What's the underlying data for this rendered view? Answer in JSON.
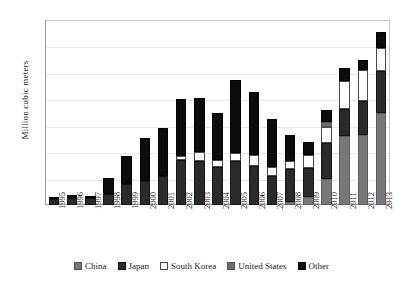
{
  "chart_data": {
    "type": "bar",
    "subtype": "stacked-vertical",
    "title": "",
    "xlabel": "",
    "ylabel": "Million cubic meters",
    "ylim": [
      0,
      7
    ],
    "yticks": [
      0,
      1,
      2,
      3,
      4,
      5,
      6,
      7
    ],
    "grid": true,
    "grid_axis": "y",
    "legend_position": "bottom",
    "stack_order_bottom_to_top": [
      "China",
      "Japan",
      "South Korea",
      "United States",
      "Other"
    ],
    "categories": [
      "1995",
      "1996",
      "1997",
      "1998",
      "1999",
      "2000",
      "2001",
      "2002",
      "2003",
      "2004",
      "2005",
      "2006",
      "2007",
      "2008",
      "2009",
      "2010",
      "2011",
      "2012",
      "2013"
    ],
    "series": [
      {
        "name": "China",
        "color": "#787878",
        "values": [
          0.0,
          0.0,
          0.0,
          0.0,
          0.0,
          0.0,
          0.0,
          0.0,
          0.0,
          0.0,
          0.0,
          0.0,
          0.0,
          0.1,
          0.3,
          1.0,
          2.6,
          2.65,
          3.5
        ]
      },
      {
        "name": "Japan",
        "color": "#2a2a2a",
        "values": [
          0.22,
          0.28,
          0.25,
          0.42,
          0.8,
          0.9,
          1.1,
          1.72,
          1.68,
          1.42,
          1.65,
          1.48,
          1.1,
          1.25,
          1.1,
          1.35,
          1.05,
          1.3,
          1.58
        ]
      },
      {
        "name": "South Korea",
        "color": "#ffffff",
        "values": [
          0.0,
          0.0,
          0.0,
          0.0,
          0.0,
          0.0,
          0.0,
          0.12,
          0.33,
          0.28,
          0.32,
          0.42,
          0.35,
          0.33,
          0.5,
          0.6,
          1.05,
          1.15,
          0.85
        ]
      },
      {
        "name": "United States",
        "color": "#6e6e6e",
        "values": [
          0.0,
          0.0,
          0.0,
          0.0,
          0.0,
          0.0,
          0.0,
          0.0,
          0.0,
          0.0,
          0.0,
          0.0,
          0.0,
          0.0,
          0.0,
          0.18,
          0.0,
          0.0,
          0.0
        ]
      },
      {
        "name": "Other",
        "color": "#0c0c0c",
        "values": [
          0.1,
          0.1,
          0.1,
          0.6,
          1.05,
          1.65,
          1.8,
          2.18,
          2.05,
          1.78,
          2.75,
          2.36,
          1.82,
          0.97,
          0.48,
          0.47,
          0.5,
          0.38,
          0.62
        ]
      }
    ],
    "totals": [
      0.32,
      0.38,
      0.35,
      1.02,
      1.85,
      2.55,
      2.9,
      4.02,
      4.06,
      3.48,
      4.72,
      4.26,
      3.27,
      2.65,
      2.38,
      3.6,
      5.2,
      5.48,
      6.55
    ]
  },
  "legend": {
    "items": [
      {
        "label": "China",
        "swatch": "china-swatch"
      },
      {
        "label": "Japan",
        "swatch": "japan-swatch"
      },
      {
        "label": "South Korea",
        "swatch": "south-korea-swatch"
      },
      {
        "label": "United States",
        "swatch": "united-states-swatch"
      },
      {
        "label": "Other",
        "swatch": "other-swatch"
      }
    ]
  }
}
